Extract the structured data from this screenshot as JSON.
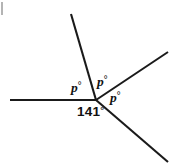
{
  "figure": {
    "kind": "angle-diagram",
    "width": 174,
    "height": 165,
    "background_color": "#ffffff",
    "stroke_color": "#1a1a1a",
    "text_color": "#111111",
    "vertex": {
      "x": 96,
      "y": 100
    },
    "rays": [
      {
        "name": "horizontal-left-ray",
        "x1": 96,
        "y1": 100,
        "x2": 10,
        "y2": 100,
        "angle_deg": 180.0
      },
      {
        "name": "upper-left-ray",
        "x1": 96,
        "y1": 100,
        "x2": 71,
        "y2": 14,
        "angle_deg": 106.2
      },
      {
        "name": "upper-right-ray",
        "x1": 96,
        "y1": 100,
        "x2": 168,
        "y2": 52,
        "angle_deg": 33.7
      },
      {
        "name": "lower-right-ray",
        "x1": 96,
        "y1": 100,
        "x2": 168,
        "y2": 162,
        "angle_deg": -40.7
      }
    ],
    "edge_tick": {
      "color": "#b4b4b4",
      "x": 1,
      "y": 2,
      "width": 2,
      "height": 13
    },
    "labels": [
      {
        "id": "p1",
        "variable": "p",
        "degree_symbol": "°",
        "text": "p°",
        "x": 71,
        "y": 81,
        "style": "italic-serif"
      },
      {
        "id": "p2",
        "variable": "p",
        "degree_symbol": "°",
        "text": "p°",
        "x": 97,
        "y": 75,
        "style": "italic-serif"
      },
      {
        "id": "p3",
        "variable": "p",
        "degree_symbol": "°",
        "text": "p°",
        "x": 110,
        "y": 91,
        "style": "italic-serif"
      },
      {
        "id": "a141",
        "value": "141",
        "degree_symbol": "°",
        "text": "141°",
        "x": 77,
        "y": 105,
        "style": "bold-sans"
      }
    ]
  },
  "text": {
    "p_variable": "p",
    "degree": "°",
    "known_angle": "141"
  }
}
